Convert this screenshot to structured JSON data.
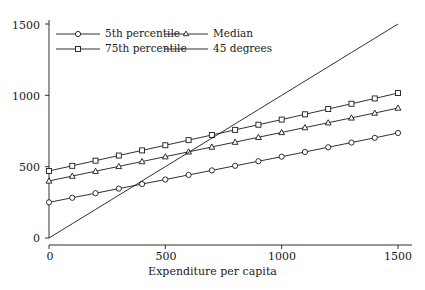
{
  "chart_data": {
    "type": "line",
    "title": "",
    "xlabel": "Expenditure per capita",
    "ylabel": "",
    "xlim": [
      0,
      1500
    ],
    "ylim": [
      0,
      1500
    ],
    "xticks": [
      0,
      500,
      1000,
      1500
    ],
    "yticks": [
      0,
      500,
      1000,
      1500
    ],
    "xtick_labels": [
      "0",
      "500",
      "1000",
      "1500"
    ],
    "ytick_labels": [
      "0",
      "500",
      "1000",
      "1500"
    ],
    "grid": false,
    "legend_position": "top-left",
    "x": [
      0,
      100,
      200,
      300,
      400,
      500,
      600,
      700,
      800,
      900,
      1000,
      1100,
      1200,
      1300,
      1400,
      1500
    ],
    "series": [
      {
        "name": "5th percentile",
        "marker": "circle",
        "color": "#1a1a1a",
        "values": [
          250,
          282,
          314,
          346,
          378,
          410,
          442,
          474,
          506,
          538,
          570,
          603,
          636,
          669,
          702,
          736
        ]
      },
      {
        "name": "Median",
        "marker": "triangle",
        "color": "#1a1a1a",
        "values": [
          400,
          434,
          468,
          502,
          536,
          570,
          604,
          638,
          672,
          706,
          740,
          774,
          808,
          842,
          876,
          911
        ]
      },
      {
        "name": "75th percentile",
        "marker": "square",
        "color": "#1a1a1a",
        "values": [
          470,
          506,
          542,
          578,
          614,
          650,
          686,
          722,
          758,
          794,
          830,
          867,
          904,
          941,
          978,
          1016
        ]
      },
      {
        "name": "45 degrees",
        "marker": "none",
        "color": "#1a1a1a",
        "values": [
          0,
          100,
          200,
          300,
          400,
          500,
          600,
          700,
          800,
          900,
          1000,
          1100,
          1200,
          1300,
          1400,
          1500
        ]
      }
    ]
  },
  "legend": {
    "entries": [
      {
        "label": "5th percentile",
        "marker": "circle"
      },
      {
        "label": "Median",
        "marker": "triangle"
      },
      {
        "label": "75th percentile",
        "marker": "square"
      },
      {
        "label": "45 degrees",
        "marker": "none"
      }
    ]
  },
  "axes": {
    "x_title": "Expenditure per capita",
    "x_tick_labels": [
      "0",
      "500",
      "1000",
      "1500"
    ],
    "y_tick_labels": [
      "0",
      "500",
      "1000",
      "1500"
    ]
  }
}
